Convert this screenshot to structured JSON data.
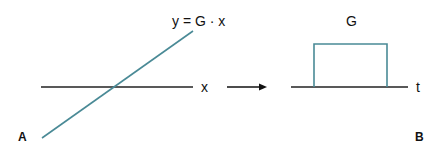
{
  "panel_a": {
    "label": "A",
    "equation": "y = G · x",
    "axis_label": "x"
  },
  "panel_b": {
    "label": "B",
    "pulse_label": "G",
    "axis_label": "t"
  },
  "colors": {
    "axis": "#222222",
    "curve": "#4a8a96",
    "text": "#111111"
  }
}
